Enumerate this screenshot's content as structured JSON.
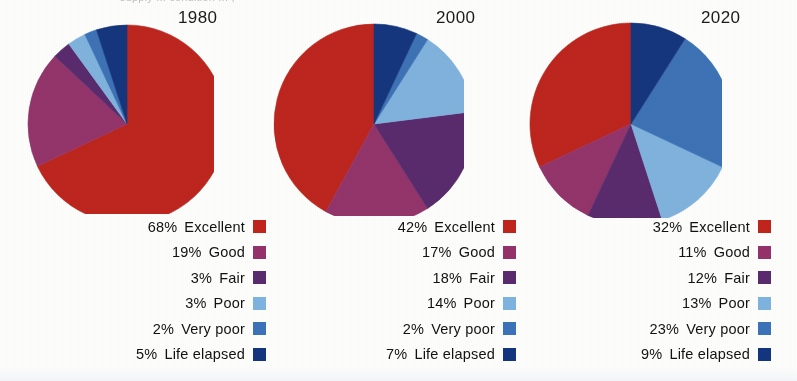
{
  "caption": {
    "top_partial_text": "supply ... condition ... ,"
  },
  "colors": {
    "excellent": "#c0241c",
    "good": "#95326b",
    "fair": "#5a2a6e",
    "poor": "#7eb3e0",
    "very_poor": "#3b72b8",
    "life_elapsed": "#13357f",
    "text": "#121212",
    "background": "#fdfdfb"
  },
  "chart_data": {
    "type": "pie",
    "title": "",
    "categories": [
      "Excellent",
      "Good",
      "Fair",
      "Poor",
      "Very poor",
      "Life elapsed"
    ],
    "legend_position": "below-right",
    "charts": [
      {
        "year": "1980",
        "values": [
          68,
          19,
          3,
          3,
          2,
          5
        ],
        "labels": [
          "68%",
          "19%",
          "3%",
          "3%",
          "2%",
          "5%"
        ],
        "start_angle_deg": 0,
        "direction": "clockwise",
        "radius": 99,
        "center_x": 113,
        "center_y": 112
      },
      {
        "year": "2000",
        "values": [
          42,
          17,
          18,
          14,
          2,
          7
        ],
        "labels": [
          "42%",
          "17%",
          "18%",
          "14%",
          "2%",
          "7%"
        ],
        "start_angle_deg": 0,
        "direction": "counter-clockwise",
        "radius": 100,
        "center_x": 112,
        "center_y": 112
      },
      {
        "year": "2020",
        "values": [
          32,
          11,
          12,
          13,
          23,
          9
        ],
        "labels": [
          "32%",
          "11%",
          "12%",
          "13%",
          "23%",
          "9%"
        ],
        "start_angle_deg": 0,
        "direction": "counter-clockwise",
        "radius": 101,
        "center_x": 113,
        "center_y": 112
      }
    ]
  },
  "panels": [
    {
      "year": "1980",
      "legend": [
        {
          "pct": "68%",
          "name": "Excellent",
          "color": "#c0241c"
        },
        {
          "pct": "19%",
          "name": "Good",
          "color": "#95326b"
        },
        {
          "pct": "3%",
          "name": "Fair",
          "color": "#5a2a6e"
        },
        {
          "pct": "3%",
          "name": "Poor",
          "color": "#7eb3e0"
        },
        {
          "pct": "2%",
          "name": "Very poor",
          "color": "#3b72b8"
        },
        {
          "pct": "5%",
          "name": "Life elapsed",
          "color": "#13357f"
        }
      ]
    },
    {
      "year": "2000",
      "legend": [
        {
          "pct": "42%",
          "name": "Excellent",
          "color": "#c0241c"
        },
        {
          "pct": "17%",
          "name": "Good",
          "color": "#95326b"
        },
        {
          "pct": "18%",
          "name": "Fair",
          "color": "#5a2a6e"
        },
        {
          "pct": "14%",
          "name": "Poor",
          "color": "#7eb3e0"
        },
        {
          "pct": "2%",
          "name": "Very poor",
          "color": "#3b72b8"
        },
        {
          "pct": "7%",
          "name": "Life elapsed",
          "color": "#13357f"
        }
      ]
    },
    {
      "year": "2020",
      "legend": [
        {
          "pct": "32%",
          "name": "Excellent",
          "color": "#c0241c"
        },
        {
          "pct": "11%",
          "name": "Good",
          "color": "#95326b"
        },
        {
          "pct": "12%",
          "name": "Fair",
          "color": "#5a2a6e"
        },
        {
          "pct": "13%",
          "name": "Poor",
          "color": "#7eb3e0"
        },
        {
          "pct": "23%",
          "name": "Very poor",
          "color": "#3b72b8"
        },
        {
          "pct": "9%",
          "name": "Life elapsed",
          "color": "#13357f"
        }
      ]
    }
  ]
}
